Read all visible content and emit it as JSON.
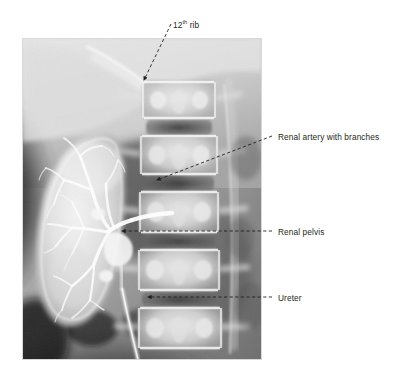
{
  "figure": {
    "kind": "radiograph",
    "modality": "intravenous-urogram-angiogram",
    "background_color": "#ffffff",
    "image_panel": {
      "x": 22,
      "y": 38,
      "width": 240,
      "height": 322,
      "border_color": "#d9d9d9"
    }
  },
  "annotations": [
    {
      "id": "rib-12",
      "label": "12",
      "label_sup": "th",
      "label_tail": " rib",
      "text_x": 173,
      "text_y": 20,
      "leader": {
        "type": "dashed-diagonal",
        "from_x": 171,
        "from_y": 24,
        "to_x": 144,
        "to_y": 80,
        "arrow": "end"
      }
    },
    {
      "id": "renal-artery",
      "label": "Renal artery with branches",
      "text_x": 278,
      "text_y": 132,
      "leader": {
        "type": "dashed-diagonal",
        "from_x": 272,
        "from_y": 136,
        "to_x": 157,
        "to_y": 180,
        "arrow": "end"
      }
    },
    {
      "id": "renal-pelvis",
      "label": "Renal pelvis",
      "text_x": 278,
      "text_y": 227,
      "leader": {
        "type": "dashed-horizontal",
        "from_x": 272,
        "from_y": 231,
        "to_x": 122,
        "to_y": 231,
        "arrow": "end"
      }
    },
    {
      "id": "ureter",
      "label": "Ureter",
      "text_x": 278,
      "text_y": 293,
      "leader": {
        "type": "dashed-horizontal",
        "from_x": 272,
        "from_y": 297,
        "to_x": 148,
        "to_y": 297,
        "arrow": "end"
      }
    }
  ],
  "colors": {
    "leader_line": "#231f20",
    "label_text": "#231f20",
    "panel_edge": "#d8d8d8"
  }
}
